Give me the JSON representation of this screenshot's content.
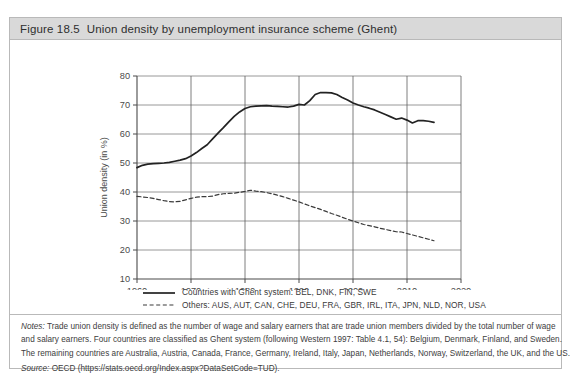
{
  "figure": {
    "number": "Figure 18.5",
    "title": "Union density by unemployment insurance scheme (Ghent)"
  },
  "notes": {
    "notes_label": "Notes:",
    "line1": "Trade union density is defined as the number of wage and salary earners that are trade union members divided by the total number of wage",
    "line2": "and salary earners. Four countries are classified as Ghent system (following Western 1997: Table 4.1, 54): Belgium, Denmark, Finland, and Sweden.",
    "line3": "The remaining countries are Australia, Austria, Canada, France, Germany, Ireland, Italy, Japan, Netherlands, Norway, Switzerland, the UK, and the US.",
    "source_label": "Source:",
    "source_text": "OECD (https://stats.oecd.org/Index.aspx?DataSetCode=TUD)."
  },
  "legend": {
    "ghent": "Countries with Ghent system: BEL, DNK, FIN, SWE",
    "others": "Others: AUS, AUT, CAN, CHE, DEU, FRA, GBR, IRL, ITA, JPN, NLD, NOR, USA"
  },
  "chart_data": {
    "type": "line",
    "title": "Union density by unemployment insurance scheme (Ghent)",
    "xlabel": "",
    "ylabel": "Union density (in %)",
    "xlim": [
      1960,
      2020
    ],
    "ylim": [
      10,
      80
    ],
    "xticks": [
      1960,
      1970,
      1980,
      1990,
      2000,
      2010,
      2020
    ],
    "yticks": [
      10,
      20,
      30,
      40,
      50,
      60,
      70,
      80
    ],
    "grid": true,
    "legend_position": "below-plot",
    "series": [
      {
        "name": "Countries with Ghent system: BEL, DNK, FIN, SWE",
        "style": "solid",
        "color": "#222222",
        "x": [
          1960,
          1961,
          1962,
          1963,
          1964,
          1965,
          1966,
          1967,
          1968,
          1969,
          1970,
          1971,
          1972,
          1973,
          1974,
          1975,
          1976,
          1977,
          1978,
          1979,
          1980,
          1981,
          1982,
          1983,
          1984,
          1985,
          1986,
          1987,
          1988,
          1989,
          1990,
          1991,
          1992,
          1993,
          1994,
          1995,
          1996,
          1997,
          1998,
          1999,
          2000,
          2001,
          2002,
          2003,
          2004,
          2005,
          2006,
          2007,
          2008,
          2009,
          2010,
          2011,
          2012,
          2013,
          2014,
          2015
        ],
        "y": [
          48.4,
          49.2,
          49.6,
          49.8,
          49.9,
          50.0,
          50.2,
          50.6,
          51.0,
          51.5,
          52.4,
          53.6,
          55.0,
          56.3,
          58.3,
          60.3,
          62.2,
          64.2,
          66.1,
          67.6,
          68.8,
          69.4,
          69.6,
          69.7,
          69.8,
          69.6,
          69.5,
          69.4,
          69.3,
          69.6,
          70.2,
          70.0,
          71.5,
          73.6,
          74.3,
          74.3,
          74.2,
          73.6,
          72.6,
          71.7,
          70.7,
          70.0,
          69.4,
          68.9,
          68.3,
          67.5,
          66.7,
          65.9,
          65.1,
          65.5,
          64.8,
          63.8,
          64.6,
          64.6,
          64.4,
          64.0
        ]
      },
      {
        "name": "Others: AUS, AUT, CAN, CHE, DEU, FRA, GBR, IRL, ITA, JPN, NLD, NOR, USA",
        "style": "dashed",
        "color": "#3a3a3a",
        "x": [
          1960,
          1961,
          1962,
          1963,
          1964,
          1965,
          1966,
          1967,
          1968,
          1969,
          1970,
          1971,
          1972,
          1973,
          1974,
          1975,
          1976,
          1977,
          1978,
          1979,
          1980,
          1981,
          1982,
          1983,
          1984,
          1985,
          1986,
          1987,
          1988,
          1989,
          1990,
          1991,
          1992,
          1993,
          1994,
          1995,
          1996,
          1997,
          1998,
          1999,
          2000,
          2001,
          2002,
          2003,
          2004,
          2005,
          2006,
          2007,
          2008,
          2009,
          2010,
          2011,
          2012,
          2013,
          2014,
          2015
        ],
        "y": [
          38.5,
          38.3,
          38.1,
          37.8,
          37.4,
          37.0,
          36.7,
          36.6,
          36.8,
          37.3,
          37.8,
          38.2,
          38.4,
          38.4,
          38.6,
          39.1,
          39.4,
          39.5,
          39.6,
          39.9,
          40.2,
          40.6,
          40.3,
          40.1,
          39.8,
          39.4,
          38.9,
          38.4,
          37.8,
          37.2,
          36.6,
          35.9,
          35.2,
          34.6,
          34.0,
          33.3,
          32.6,
          32.0,
          31.3,
          30.6,
          30.0,
          29.4,
          28.8,
          28.4,
          28.0,
          27.5,
          27.1,
          26.7,
          26.3,
          26.2,
          25.7,
          25.2,
          24.7,
          24.2,
          23.7,
          23.2
        ]
      }
    ]
  }
}
